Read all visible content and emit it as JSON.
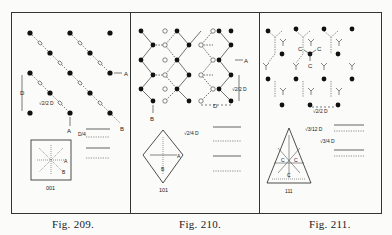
{
  "figures": [
    {
      "id": "fig209",
      "caption": "Fig. 209.",
      "face_label": "001",
      "labels": {
        "A_right": "A",
        "B_diag": "B",
        "A_bottom": "A",
        "spacing": "√2/2 D",
        "D_vertical": "D",
        "sep_label": "D/4",
        "inset_A": "A",
        "inset_B": "B"
      }
    },
    {
      "id": "fig210",
      "caption": "Fig. 210.",
      "face_label": "101",
      "labels": {
        "A_right": "A",
        "B_bottom": "B",
        "spacing_vertical": "√2/2 D",
        "D_horizontal": "D",
        "sep_label": "√2/4 D",
        "inset_A": "A",
        "inset_B": "B"
      }
    },
    {
      "id": "fig211",
      "caption": "Fig. 211.",
      "face_label": "111",
      "labels": {
        "C1": "C",
        "C2": "C",
        "C3": "C",
        "spacing": "√2/2 D",
        "sep_label_1": "√3/12 D",
        "sep_label_2": "√3/4 D",
        "inset_C1": "C",
        "inset_C2": "C",
        "inset_C3": "C"
      }
    }
  ]
}
